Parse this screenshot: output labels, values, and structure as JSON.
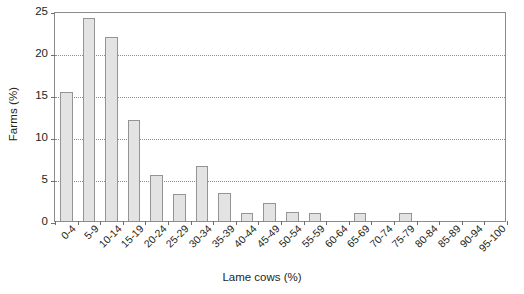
{
  "chart_data": {
    "type": "bar",
    "title": "",
    "xlabel": "Lame cows (%)",
    "ylabel": "Farms (%)",
    "categories": [
      "0-4",
      "5-9",
      "10-14",
      "15-19",
      "20-24",
      "25-29",
      "30-34",
      "35-39",
      "40-44",
      "45-49",
      "50-54",
      "55-59",
      "60-64",
      "65-69",
      "70-74",
      "75-79",
      "80-84",
      "85-89",
      "90-94",
      "95-100"
    ],
    "values": [
      15.4,
      24.2,
      21.9,
      12.0,
      5.5,
      3.2,
      6.5,
      3.3,
      1.0,
      2.1,
      1.1,
      1.0,
      0,
      1.0,
      0,
      1.0,
      0,
      0,
      0,
      0
    ],
    "ylim": [
      0,
      25
    ],
    "yticks": [
      0,
      5,
      10,
      15,
      20,
      25
    ],
    "ytick_labels": [
      "0",
      "5",
      "10",
      "15",
      "20",
      "25"
    ],
    "grid": "horizontal-dotted",
    "legend": "none",
    "bar_fill": "#e3e3e3",
    "bar_stroke": "#949494",
    "axis_color": "#8c8c8c",
    "text_color": "#231f20"
  }
}
